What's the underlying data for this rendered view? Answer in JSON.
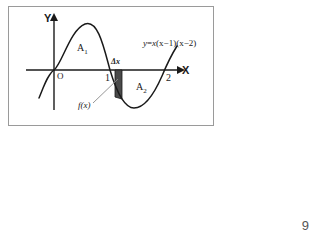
{
  "figure": {
    "page_number": "9",
    "axes": {
      "y_axis_label": "Y",
      "x_axis_label": "X",
      "origin_label": "O",
      "x_ticks": [
        {
          "value": 1,
          "label": "1"
        },
        {
          "value": 2,
          "label": "2"
        }
      ]
    },
    "curve": {
      "equation_label": "y=x(x−1)(x−2)",
      "equation_parts": {
        "y": "y",
        "equals": "=",
        "x1": "x",
        "factor1": "(x−1)",
        "factor2": "(x−2)"
      }
    },
    "annotations": {
      "area_above_main": "A",
      "area_above_sub": "1",
      "area_below_main": "A",
      "area_below_sub": "2",
      "delta_x_label": "Δx",
      "fx_label": "f(x)"
    },
    "colors": {
      "stroke": "#1a1a1a",
      "strip_fill": "#4a4a4a",
      "frame_border": "#9a9a9a",
      "background": "#ffffff",
      "page_number": "#555555"
    }
  }
}
